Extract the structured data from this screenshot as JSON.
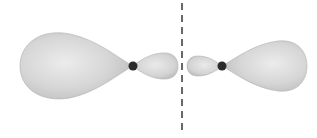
{
  "diagram": {
    "type": "hybrid-orbital-diagram",
    "colors": {
      "background": "#ffffff",
      "lobe_fill_light": "#e6e6e6",
      "lobe_fill_mid": "#d2d2d2",
      "lobe_fill_dark": "#b9b9b9",
      "lobe_edge": "#a8a8a8",
      "nucleus": "#2b2b2b",
      "dashed_line": "#444444"
    },
    "left_orbital": {
      "nucleus": {
        "cx": 133,
        "cy": 66,
        "r": 4.5
      },
      "large_lobe": {
        "x_start": 20,
        "x_end": 130,
        "y_top": 33,
        "y_bottom": 98
      },
      "small_lobe": {
        "x_start": 137,
        "x_end": 178,
        "y_top": 53,
        "y_bottom": 79
      }
    },
    "right_orbital": {
      "nucleus": {
        "cx": 222,
        "cy": 66,
        "r": 4.5
      },
      "small_lobe": {
        "x_start": 187,
        "x_end": 218,
        "y_top": 56,
        "y_bottom": 76
      },
      "large_lobe": {
        "x_start": 226,
        "x_end": 307,
        "y_top": 40,
        "y_bottom": 92
      }
    },
    "separator": {
      "x": 182,
      "y_start": 3,
      "y_end": 135,
      "style": "dashed"
    }
  }
}
